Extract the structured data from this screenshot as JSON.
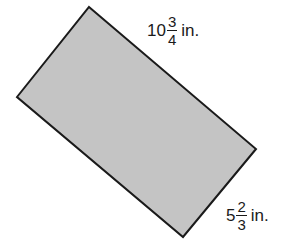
{
  "figure": {
    "shape": "rectangle",
    "fill_color": "#c4c4c4",
    "stroke_color": "#1a1a1a",
    "vertices": [
      [
        89,
        7
      ],
      [
        256,
        149
      ],
      [
        183,
        237
      ],
      [
        17,
        97
      ]
    ]
  },
  "labels": {
    "length": {
      "whole": "10",
      "numerator": "3",
      "denominator": "4",
      "unit": "in."
    },
    "width": {
      "whole": "5",
      "numerator": "2",
      "denominator": "3",
      "unit": "in."
    }
  }
}
